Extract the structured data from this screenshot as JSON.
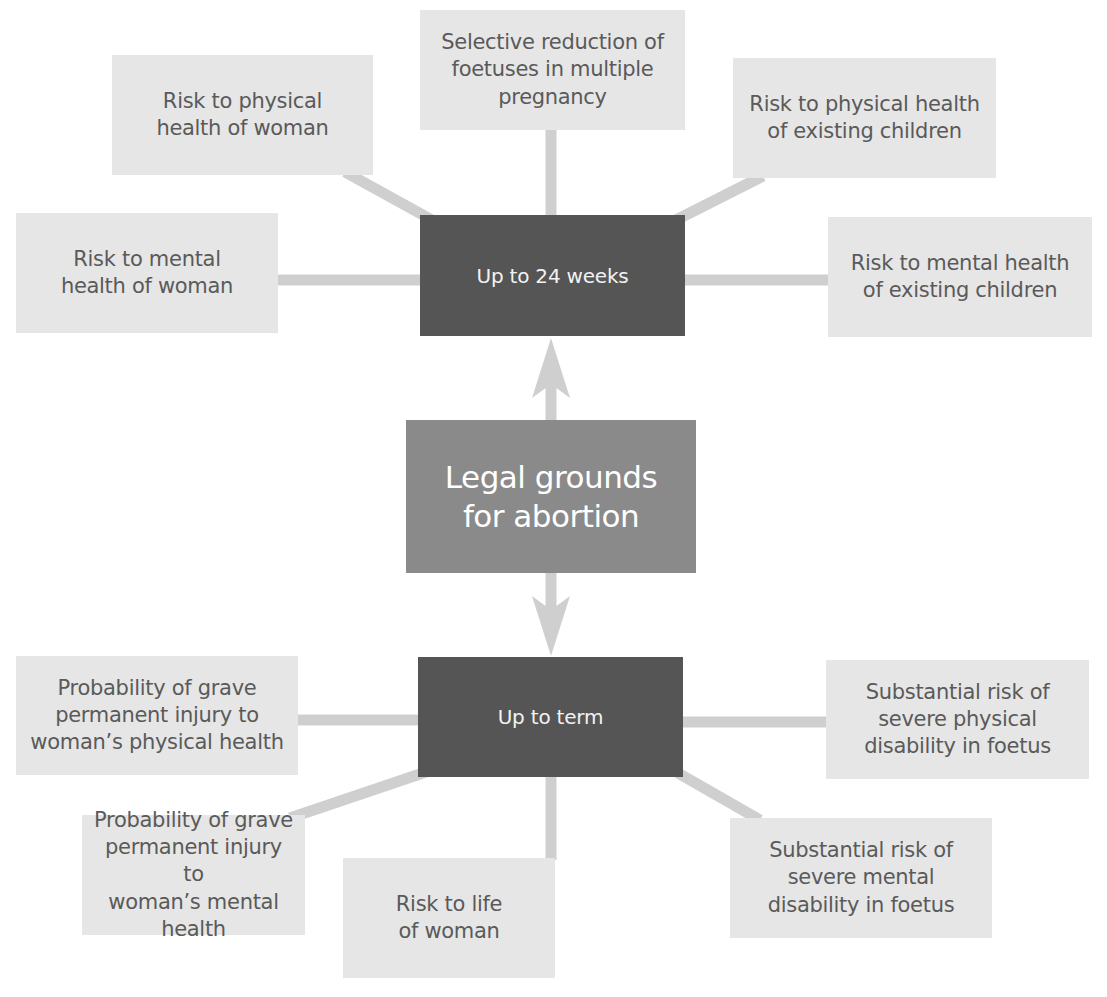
{
  "diagram": {
    "title": "Legal grounds for abortion",
    "colors": {
      "leaf_fill": "#e6e6e6",
      "leaf_text": "#5a5a5a",
      "phase_fill": "#555555",
      "phase_text": "#f2f2f2",
      "center_fill": "#8a8a8a",
      "center_text": "#ffffff",
      "connector": "#cfcfcf"
    },
    "center": {
      "label": "Legal grounds\nfor abortion"
    },
    "phases": [
      {
        "id": "upper",
        "label": "Up to 24 weeks",
        "arrow": "up",
        "grounds": [
          {
            "label": "Risk to physical\nhealth of woman"
          },
          {
            "label": "Selective reduction of\nfoetuses in multiple\npregnancy"
          },
          {
            "label": "Risk to physical health\nof existing children"
          },
          {
            "label": "Risk to mental\nhealth of woman"
          },
          {
            "label": "Risk to mental health\nof existing children"
          }
        ]
      },
      {
        "id": "lower",
        "label": "Up to term",
        "arrow": "down",
        "grounds": [
          {
            "label": "Probability of grave\npermanent injury to\nwoman’s physical health"
          },
          {
            "label": "Substantial risk of\nsevere physical\ndisability in foetus"
          },
          {
            "label": "Probability of grave\npermanent injury to\nwoman’s mental health"
          },
          {
            "label": "Risk to life\nof woman"
          },
          {
            "label": "Substantial risk of\nsevere mental\ndisability in foetus"
          }
        ]
      }
    ],
    "edges": [
      {
        "from": "center",
        "to": "Up to 24 weeks",
        "type": "arrow"
      },
      {
        "from": "center",
        "to": "Up to term",
        "type": "arrow"
      },
      {
        "from": "Up to 24 weeks",
        "to": "Risk to physical health of woman",
        "type": "line"
      },
      {
        "from": "Up to 24 weeks",
        "to": "Selective reduction of foetuses in multiple pregnancy",
        "type": "line"
      },
      {
        "from": "Up to 24 weeks",
        "to": "Risk to physical health of existing children",
        "type": "line"
      },
      {
        "from": "Up to 24 weeks",
        "to": "Risk to mental health of woman",
        "type": "line"
      },
      {
        "from": "Up to 24 weeks",
        "to": "Risk to mental health of existing children",
        "type": "line"
      },
      {
        "from": "Up to term",
        "to": "Probability of grave permanent injury to woman's physical health",
        "type": "line"
      },
      {
        "from": "Up to term",
        "to": "Substantial risk of severe physical disability in foetus",
        "type": "line"
      },
      {
        "from": "Up to term",
        "to": "Probability of grave permanent injury to woman's mental health",
        "type": "line"
      },
      {
        "from": "Up to term",
        "to": "Risk to life of woman",
        "type": "line"
      },
      {
        "from": "Up to term",
        "to": "Substantial risk of severe mental disability in foetus",
        "type": "line"
      }
    ]
  }
}
